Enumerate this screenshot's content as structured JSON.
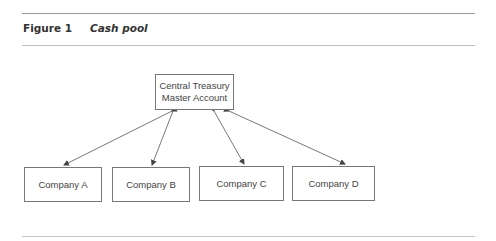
{
  "figure": {
    "label": "Figure 1",
    "title": "Cash pool"
  },
  "diagram": {
    "central": {
      "line1": "Central Treasury",
      "line2": "Master Account"
    },
    "companies": [
      {
        "label": "Company A"
      },
      {
        "label": "Company B"
      },
      {
        "label": "Company C"
      },
      {
        "label": "Company D"
      }
    ],
    "edges": [
      {
        "from": "Central Treasury Master Account",
        "to": "Company A",
        "direction": "bidirectional"
      },
      {
        "from": "Central Treasury Master Account",
        "to": "Company B",
        "direction": "bidirectional"
      },
      {
        "from": "Central Treasury Master Account",
        "to": "Company C",
        "direction": "bidirectional"
      },
      {
        "from": "Central Treasury Master Account",
        "to": "Company D",
        "direction": "bidirectional"
      }
    ],
    "colors": {
      "line": "#555555",
      "border": "#777777",
      "rule": "#9a9a9a"
    }
  }
}
